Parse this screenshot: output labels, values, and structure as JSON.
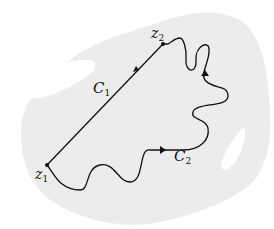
{
  "diagram": {
    "labels": {
      "z1": {
        "base": "z",
        "sub": "1"
      },
      "z2": {
        "base": "z",
        "sub": "2"
      },
      "C1": {
        "base": "C",
        "sub": "1"
      },
      "C2": {
        "base": "C",
        "sub": "2"
      }
    },
    "colors": {
      "region_fill": "#ececec",
      "hole_fill": "#ffffff",
      "curve_stroke": "#111111"
    }
  }
}
